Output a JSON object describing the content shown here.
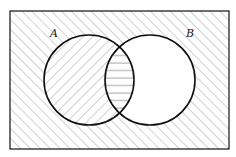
{
  "diagram": {
    "type": "venn",
    "universe": {
      "x": 10,
      "y": 11,
      "width": 219,
      "height": 138,
      "shading": "diagonal-hatch-up-right"
    },
    "sets": [
      {
        "name": "A",
        "label": "A",
        "cx": 89,
        "cy": 80,
        "r": 45,
        "shading": "diagonal-hatch-down-right",
        "label_x": 50,
        "label_y": 37
      },
      {
        "name": "B",
        "label": "B",
        "cx": 150,
        "cy": 80,
        "r": 45,
        "shading": "none",
        "label_x": 186,
        "label_y": 37
      }
    ],
    "intersection": {
      "sets": [
        "A",
        "B"
      ],
      "shading": "horizontal-lines"
    },
    "colors": {
      "stroke": "#111111",
      "hatch": "#8a8a8a",
      "background": "#ffffff"
    }
  }
}
